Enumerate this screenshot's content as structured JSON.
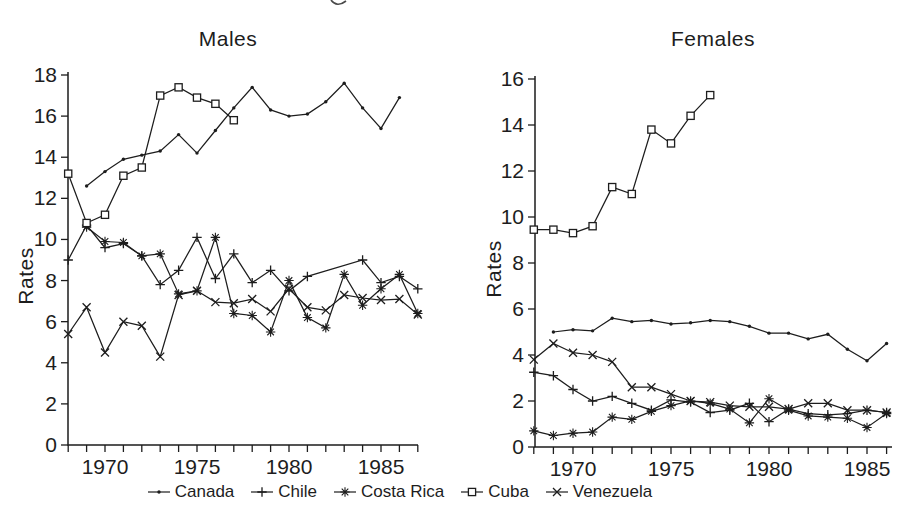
{
  "figure": {
    "background": "#ffffff",
    "ink_color": "#1d1d1d",
    "legend": [
      {
        "label": "Canada",
        "marker": "dot"
      },
      {
        "label": "Chile",
        "marker": "plus"
      },
      {
        "label": "Costa Rica",
        "marker": "asterisk"
      },
      {
        "label": "Cuba",
        "marker": "square"
      },
      {
        "label": "Venezuela",
        "marker": "cross"
      }
    ]
  },
  "chart_data": [
    {
      "type": "line",
      "title": "Males",
      "ylabel": "Rates",
      "ylim": [
        0,
        18
      ],
      "ytick_step": 2,
      "xrange": [
        1968,
        1987
      ],
      "xticks": [
        1970,
        1975,
        1980,
        1985
      ],
      "grid": false,
      "legend_position": "bottom",
      "series": [
        {
          "name": "Canada",
          "marker": "dot",
          "years": [
            1969,
            1970,
            1971,
            1972,
            1973,
            1974,
            1975,
            1976,
            1977,
            1978,
            1979,
            1980,
            1981,
            1982,
            1983,
            1984,
            1985,
            1986
          ],
          "values": [
            12.6,
            13.3,
            13.9,
            14.1,
            14.3,
            15.1,
            14.2,
            15.3,
            16.4,
            17.4,
            16.3,
            16.0,
            16.1,
            16.7,
            17.6,
            16.4,
            15.4,
            16.9
          ]
        },
        {
          "name": "Chile",
          "marker": "plus",
          "years": [
            1968,
            1969,
            1970,
            1971,
            1972,
            1973,
            1974,
            1975,
            1976,
            1977,
            1978,
            1979,
            1980,
            1981,
            1984,
            1985,
            1986,
            1987
          ],
          "values": [
            9.0,
            10.7,
            9.6,
            9.8,
            9.2,
            7.8,
            8.5,
            10.1,
            8.1,
            9.3,
            7.9,
            8.5,
            7.5,
            8.2,
            9.0,
            7.9,
            8.2,
            7.6
          ]
        },
        {
          "name": "Costa Rica",
          "marker": "asterisk",
          "years": [
            1969,
            1970,
            1971,
            1972,
            1973,
            1974,
            1975,
            1976,
            1977,
            1978,
            1979,
            1980,
            1981,
            1982,
            1983,
            1984,
            1985,
            1986,
            1987
          ],
          "values": [
            10.6,
            9.9,
            9.85,
            9.2,
            9.3,
            7.35,
            7.5,
            10.1,
            6.4,
            6.3,
            5.5,
            8.0,
            6.2,
            5.7,
            8.3,
            6.8,
            7.6,
            8.3,
            6.4
          ]
        },
        {
          "name": "Cuba",
          "marker": "square",
          "years": [
            1968,
            1969,
            1970,
            1971,
            1972,
            1973,
            1974,
            1975,
            1976,
            1977
          ],
          "values": [
            13.2,
            10.8,
            11.2,
            13.1,
            13.5,
            17.0,
            17.4,
            16.9,
            16.6,
            15.8
          ]
        },
        {
          "name": "Venezuela",
          "marker": "cross",
          "years": [
            1968,
            1969,
            1970,
            1971,
            1972,
            1973,
            1974,
            1975,
            1976,
            1977,
            1978,
            1979,
            1980,
            1981,
            1982,
            1983,
            1984,
            1985,
            1986,
            1987
          ],
          "values": [
            5.4,
            6.7,
            4.5,
            6.0,
            5.8,
            4.3,
            7.3,
            7.5,
            6.95,
            6.9,
            7.1,
            6.5,
            7.6,
            6.7,
            6.55,
            7.3,
            7.15,
            7.05,
            7.1,
            6.35
          ]
        }
      ]
    },
    {
      "type": "line",
      "title": "Females",
      "ylabel": "Rates",
      "ylim": [
        0,
        16
      ],
      "ytick_step": 2,
      "xrange": [
        1968,
        1986
      ],
      "xticks": [
        1970,
        1975,
        1980,
        1985
      ],
      "grid": false,
      "legend_position": "bottom",
      "series": [
        {
          "name": "Canada",
          "marker": "dot",
          "years": [
            1969,
            1970,
            1971,
            1972,
            1973,
            1974,
            1975,
            1976,
            1977,
            1978,
            1979,
            1980,
            1981,
            1982,
            1983,
            1984,
            1985,
            1986
          ],
          "values": [
            5.0,
            5.1,
            5.05,
            5.6,
            5.45,
            5.5,
            5.35,
            5.4,
            5.5,
            5.45,
            5.25,
            4.95,
            4.95,
            4.7,
            4.9,
            4.25,
            3.75,
            4.5
          ]
        },
        {
          "name": "Chile",
          "marker": "plus",
          "years": [
            1968,
            1969,
            1970,
            1971,
            1972,
            1973,
            1974,
            1975,
            1976,
            1977,
            1978,
            1979,
            1980,
            1981,
            1982,
            1983,
            1984,
            1985,
            1986
          ],
          "values": [
            3.25,
            3.1,
            2.5,
            2.0,
            2.2,
            1.9,
            1.6,
            2.05,
            1.95,
            1.5,
            1.6,
            1.9,
            1.1,
            1.65,
            1.45,
            1.4,
            1.45,
            1.6,
            1.5
          ]
        },
        {
          "name": "Costa Rica",
          "marker": "asterisk",
          "years": [
            1968,
            1969,
            1970,
            1971,
            1972,
            1973,
            1974,
            1975,
            1976,
            1977,
            1978,
            1979,
            1980,
            1981,
            1982,
            1983,
            1984,
            1985,
            1986
          ],
          "values": [
            0.7,
            0.5,
            0.6,
            0.65,
            1.3,
            1.2,
            1.55,
            1.8,
            2.0,
            1.9,
            1.65,
            1.05,
            2.1,
            1.6,
            1.35,
            1.3,
            1.25,
            0.85,
            1.45
          ]
        },
        {
          "name": "Cuba",
          "marker": "square",
          "years": [
            1968,
            1969,
            1970,
            1971,
            1972,
            1973,
            1974,
            1975,
            1976,
            1977
          ],
          "values": [
            9.45,
            9.45,
            9.3,
            9.6,
            11.3,
            11.0,
            13.8,
            13.2,
            14.4,
            15.3
          ]
        },
        {
          "name": "Venezuela",
          "marker": "cross",
          "years": [
            1968,
            1969,
            1970,
            1971,
            1972,
            1973,
            1974,
            1975,
            1976,
            1977,
            1978,
            1979,
            1980,
            1981,
            1982,
            1983,
            1984,
            1985,
            1986
          ],
          "values": [
            3.8,
            4.5,
            4.1,
            4.0,
            3.7,
            2.6,
            2.6,
            2.3,
            2.0,
            1.95,
            1.8,
            1.75,
            1.75,
            1.65,
            1.9,
            1.9,
            1.6,
            1.6,
            1.5
          ]
        }
      ]
    }
  ]
}
